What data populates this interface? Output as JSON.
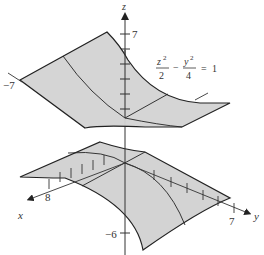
{
  "figure": {
    "type": "3d-surface-diagram",
    "surface": "hyperbolic cylinder",
    "equation": {
      "term1_num": "z",
      "term1_exp": "2",
      "term1_den": "2",
      "operator": "−",
      "term2_num": "y",
      "term2_exp": "2",
      "term2_den": "4",
      "equals": "=",
      "rhs": "1"
    },
    "axes": {
      "x": {
        "label": "x",
        "tick_label": "8"
      },
      "y": {
        "label": "y",
        "tick_label": "7"
      },
      "z": {
        "label": "z",
        "tick_label_top": "7",
        "tick_label_bottom": "−6"
      },
      "left_label": "−7"
    },
    "colors": {
      "surface_fill": "#d3d3d3",
      "edge": "#222222",
      "axis": "#333333",
      "background": "#ffffff"
    }
  }
}
